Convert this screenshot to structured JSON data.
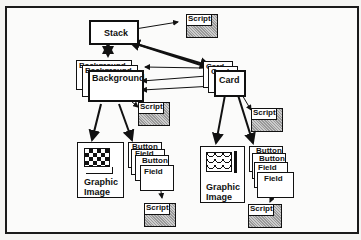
{
  "diagram": {
    "stack": {
      "label": "Stack"
    },
    "backgrounds": [
      {
        "label": "Background"
      },
      {
        "label": "Background"
      },
      {
        "label": "Background"
      }
    ],
    "cards": [
      {
        "label": "Card"
      },
      {
        "label": "Card"
      },
      {
        "label": "Card"
      }
    ],
    "scripts": {
      "stack_script": "Script",
      "background_script": "Script",
      "card_script": "Script",
      "bg_buttons_script": "Script",
      "card_buttons_script": "Script"
    },
    "bg_graphic": {
      "label_line1": "Graphic",
      "label_line2": "Image"
    },
    "card_graphic": {
      "label_line1": "Graphic",
      "label_line2": "Image"
    },
    "bg_objects": [
      {
        "label": "Button"
      },
      {
        "label": "Field"
      },
      {
        "label": "Button"
      },
      {
        "label": "Field"
      }
    ],
    "card_objects": [
      {
        "label": "Button"
      },
      {
        "label": "Button"
      },
      {
        "label": "Field"
      },
      {
        "label": "Field"
      }
    ]
  }
}
